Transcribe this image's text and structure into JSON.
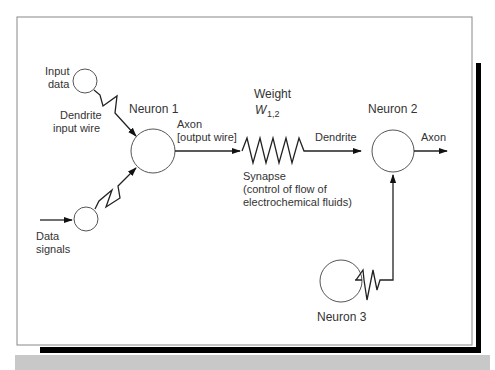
{
  "diagram": {
    "colors": {
      "frame": "#888888",
      "shadow": "#000000",
      "band": "#c8c8c8",
      "line": "#222222",
      "text": "#333333"
    },
    "nodes": [
      {
        "id": "input-data",
        "label_lines": [
          "Input",
          "data"
        ]
      },
      {
        "id": "data-signals",
        "label_lines": [
          "Data",
          "signals"
        ]
      },
      {
        "id": "neuron-1",
        "label": "Neuron 1"
      },
      {
        "id": "neuron-2",
        "label": "Neuron 2"
      },
      {
        "id": "neuron-3",
        "label": "Neuron 3"
      }
    ],
    "labels": {
      "input_data_1": "Input",
      "input_data_2": "data",
      "dendrite_input_1": "Dendrite",
      "dendrite_input_2": "input wire",
      "data_signals_1": "Data",
      "data_signals_2": "signals",
      "neuron1": "Neuron 1",
      "axon_output_1": "Axon",
      "axon_output_2": "[output wire]",
      "weight": "Weight",
      "weight_symbol": "W",
      "weight_subscript": "1,2",
      "synapse_1": "Synapse",
      "synapse_2": "(control of flow of",
      "synapse_3": "electrochemical fluids)",
      "dendrite": "Dendrite",
      "neuron2": "Neuron 2",
      "axon": "Axon",
      "neuron3": "Neuron 3"
    },
    "edges": [
      {
        "from": "input-data",
        "to": "neuron-1",
        "via": "dendrite input wire"
      },
      {
        "from": "data-signals",
        "to": "neuron-1"
      },
      {
        "from": "neuron-1",
        "to": "neuron-2",
        "via": "synapse W1,2"
      },
      {
        "from": "neuron-3",
        "to": "neuron-2"
      },
      {
        "from": "neuron-2",
        "to": "axon output"
      }
    ]
  }
}
